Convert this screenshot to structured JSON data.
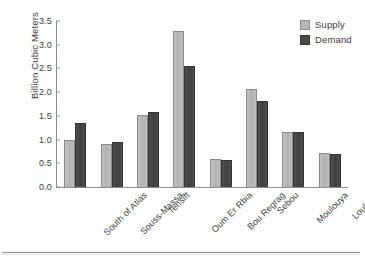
{
  "chart_data": {
    "type": "bar",
    "title": "",
    "xlabel": "",
    "ylabel": "Billion Cubic Meters",
    "ylim": [
      0.0,
      3.5
    ],
    "yticks": [
      "0.0",
      "0.5",
      "1.0",
      "1.5",
      "2.0",
      "2.5",
      "3.0",
      "3.5"
    ],
    "ytick_values": [
      0.0,
      0.5,
      1.0,
      1.5,
      2.0,
      2.5,
      3.0,
      3.5
    ],
    "grid": false,
    "legend_position": "top-right",
    "categories": [
      "South of Atlas",
      "Souss-Massa",
      "Tensift",
      "Oum Er Rbia",
      "Bou Regrag",
      "Sebou",
      "Moulouya",
      "Loukkos"
    ],
    "series": [
      {
        "name": "Supply",
        "color": "#b8b8b8",
        "values": [
          1.0,
          0.9,
          1.52,
          3.3,
          0.6,
          2.06,
          1.17,
          0.72
        ]
      },
      {
        "name": "Demand",
        "color": "#474747",
        "values": [
          1.35,
          0.95,
          1.58,
          2.55,
          0.56,
          1.81,
          1.16,
          0.7
        ]
      }
    ]
  },
  "legend": {
    "items": [
      {
        "label": "Supply"
      },
      {
        "label": "Demand"
      }
    ]
  }
}
